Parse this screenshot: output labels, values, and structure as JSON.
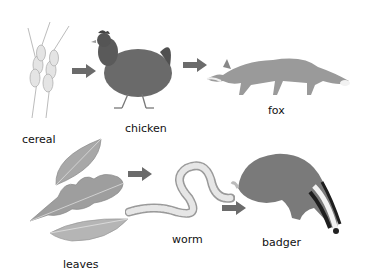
{
  "diagram": {
    "type": "food-chains",
    "arrow_color": "#6b6b6b",
    "chains": [
      {
        "name": "top-chain",
        "organisms": [
          {
            "id": "cereal",
            "label": "cereal"
          },
          {
            "id": "chicken",
            "label": "chicken"
          },
          {
            "id": "fox",
            "label": "fox"
          }
        ]
      },
      {
        "name": "bottom-chain",
        "organisms": [
          {
            "id": "leaves",
            "label": "leaves"
          },
          {
            "id": "worm",
            "label": "worm"
          },
          {
            "id": "badger",
            "label": "badger"
          }
        ]
      }
    ]
  }
}
